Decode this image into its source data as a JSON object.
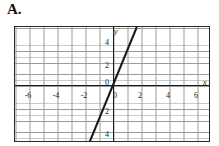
{
  "problem": {
    "label": "A."
  },
  "chart_data": {
    "type": "line",
    "title": "",
    "xlabel": "x",
    "ylabel": "y",
    "xlim": [
      -7,
      7
    ],
    "ylim": [
      -5,
      5
    ],
    "grid": true,
    "grid_major_step": 1,
    "grid_minor_step": 0.5,
    "legend": "none",
    "series": [
      {
        "name": "line",
        "equation": "y = 3x",
        "slope": 3,
        "intercept": 0,
        "points": [
          [
            -1.7,
            -5
          ],
          [
            1.7,
            5
          ]
        ]
      }
    ],
    "x_ticks": [
      {
        "value": -6,
        "label": "-6"
      },
      {
        "value": -4,
        "label": "-4"
      },
      {
        "value": -2,
        "label": "-2"
      },
      {
        "value": 0,
        "label": "0"
      },
      {
        "value": 2,
        "label": "2"
      },
      {
        "value": 4,
        "label": "4"
      },
      {
        "value": 6,
        "label": "6"
      }
    ],
    "y_ticks": [
      {
        "value": 4,
        "label": "4"
      },
      {
        "value": 2,
        "label": "2"
      },
      {
        "value": 0,
        "label": "0"
      },
      {
        "value": -2,
        "label": "2"
      },
      {
        "value": -4,
        "label": "4"
      }
    ],
    "colors": {
      "line": "#1a1a1a",
      "axis": "#1a1a1a",
      "grid_major": "#9a9a9a",
      "grid_minor": "#c9c9c9",
      "frame": "#2a2a2a",
      "background": "#ffffff"
    }
  }
}
